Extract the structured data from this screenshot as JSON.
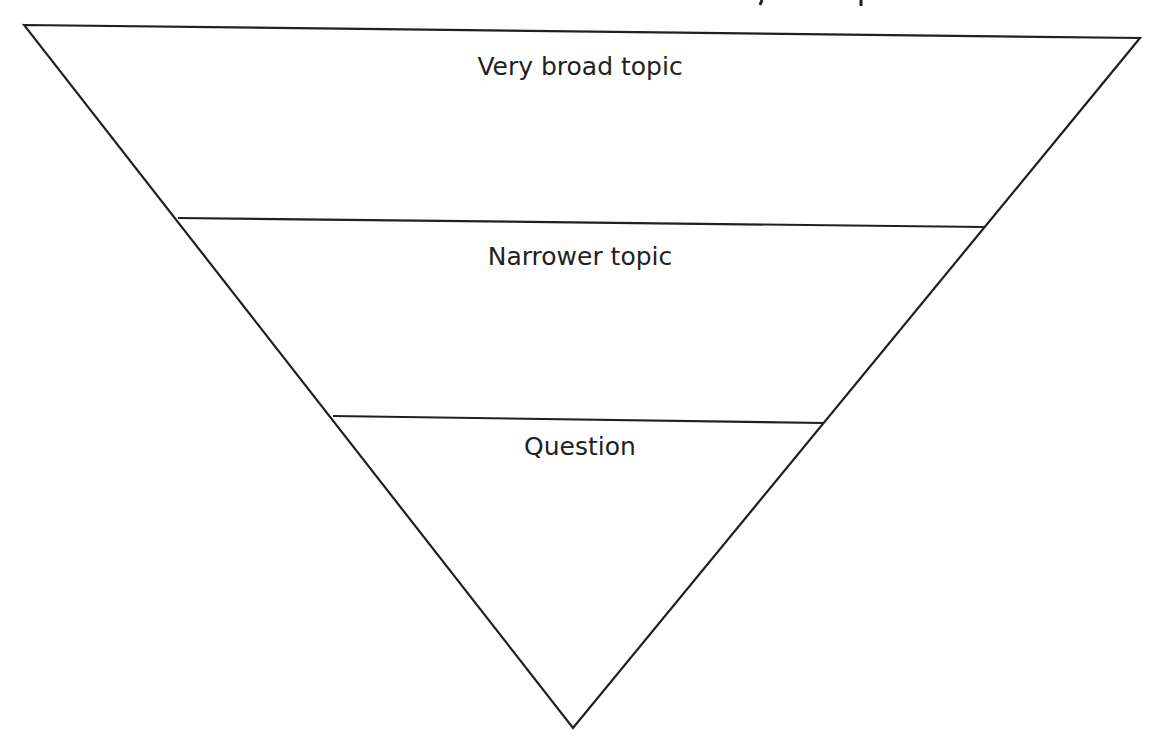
{
  "diagram": {
    "type": "inverted-funnel",
    "title_visible_fragment": "",
    "stroke_color": "#231f20",
    "text_color": "#231f20",
    "background": "#ffffff",
    "levels": [
      {
        "label": "Very broad topic"
      },
      {
        "label": "Narrower topic"
      },
      {
        "label": "Question"
      }
    ]
  }
}
